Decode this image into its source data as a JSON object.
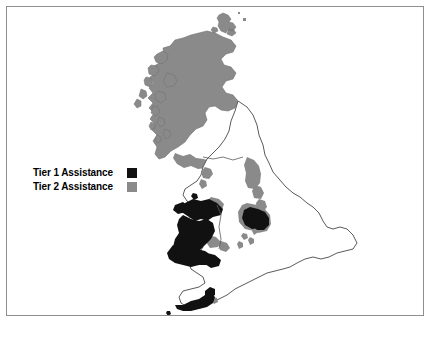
{
  "figure": {
    "type": "thematic-choropleth-map",
    "region": "United Kingdom",
    "title": "",
    "background_color": "#ffffff",
    "frame_color": "#8e8e8e"
  },
  "legend": {
    "position": "left-center",
    "items": [
      {
        "label": "Tier 1 Assistance",
        "color": "#111111",
        "swatch_name": "tier-1-swatch"
      },
      {
        "label": "Tier 2 Assistance",
        "color": "#8a8a8a",
        "swatch_name": "tier-2-swatch"
      }
    ]
  },
  "map": {
    "coastline_color": "#5a5a5a",
    "unassisted_color": "#ffffff",
    "tier1_color": "#111111",
    "tier2_color": "#8a8a8a",
    "areas": [
      {
        "name": "Scotland Highlands and Islands",
        "tier": 2
      },
      {
        "name": "Outer Hebrides",
        "tier": 2
      },
      {
        "name": "Inner Hebrides",
        "tier": 2
      },
      {
        "name": "Orkney Islands",
        "tier": 2
      },
      {
        "name": "Southern Uplands coast",
        "tier": 2
      },
      {
        "name": "North East England coast",
        "tier": 2
      },
      {
        "name": "Cumbria coast",
        "tier": 2
      },
      {
        "name": "Merseyside",
        "tier": 1
      },
      {
        "name": "North Wales",
        "tier": 1
      },
      {
        "name": "Mid and West Wales",
        "tier": 1
      },
      {
        "name": "South Wales Valleys",
        "tier": 1
      },
      {
        "name": "West Midlands patch",
        "tier": 1
      },
      {
        "name": "South Yorkshire",
        "tier": 1
      },
      {
        "name": "Cornwall and West Devon",
        "tier": 1
      },
      {
        "name": "South East England",
        "tier": 0
      }
    ]
  }
}
